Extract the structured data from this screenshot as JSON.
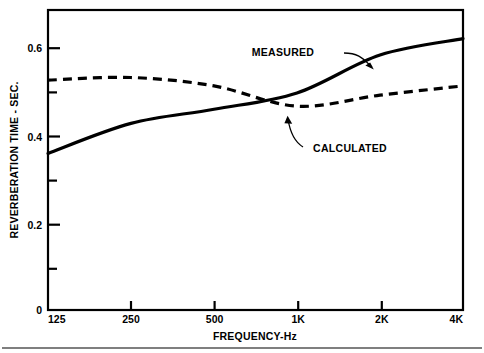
{
  "chart_data": {
    "type": "line",
    "title": "",
    "xlabel": "FREQUENCY-Hz",
    "ylabel": "REVERBERATION TIME - SEC.",
    "x_scale": "log-octave",
    "x": [
      125,
      250,
      500,
      1000,
      2000,
      4000
    ],
    "categories": [
      "125",
      "250",
      "500",
      "1K",
      "2K",
      "4K"
    ],
    "xticklabels": [
      "125",
      "250",
      "500",
      "1K",
      "2K",
      "4K"
    ],
    "yticklabels": [
      "0",
      "0.2",
      "0.4",
      "0.6"
    ],
    "ytickvalues": [
      0,
      0.2,
      0.4,
      0.6
    ],
    "yminorticks": [
      0.1,
      0.3,
      0.5
    ],
    "ylim": [
      0,
      0.68
    ],
    "grid": false,
    "legend_position": "inline-annotation",
    "series": [
      {
        "name": "MEASURED",
        "style": "solid",
        "color": "#000000",
        "values": [
          0.355,
          0.423,
          0.455,
          0.492,
          0.578,
          0.615
        ]
      },
      {
        "name": "CALCULATED",
        "style": "dashed",
        "color": "#000000",
        "values": [
          0.521,
          0.527,
          0.508,
          0.462,
          0.487,
          0.508
        ]
      }
    ],
    "annotations": [
      {
        "text": "MEASURED",
        "points_to_series": "MEASURED",
        "points_to_x": 1500
      },
      {
        "text": "CALCULATED",
        "points_to_series": "CALCULATED",
        "points_to_x": 1000
      }
    ]
  },
  "axes": {
    "y_title": "REVERBERATION TIME - SEC.",
    "x_title": "FREQUENCY-Hz",
    "y_ticks": [
      {
        "label": "0.6",
        "value": 0.6
      },
      {
        "label": "0.4",
        "value": 0.4
      },
      {
        "label": "0.2",
        "value": 0.2
      },
      {
        "label": "0",
        "value": 0
      }
    ],
    "x_ticks": [
      {
        "label": "125",
        "value": 125
      },
      {
        "label": "250",
        "value": 250
      },
      {
        "label": "500",
        "value": 500
      },
      {
        "label": "1K",
        "value": 1000
      },
      {
        "label": "2K",
        "value": 2000
      },
      {
        "label": "4K",
        "value": 4000
      }
    ]
  },
  "annotations": {
    "measured_label": "MEASURED",
    "calculated_label": "CALCULATED"
  },
  "colors": {
    "background": "#ffffff",
    "ink": "#000000"
  }
}
